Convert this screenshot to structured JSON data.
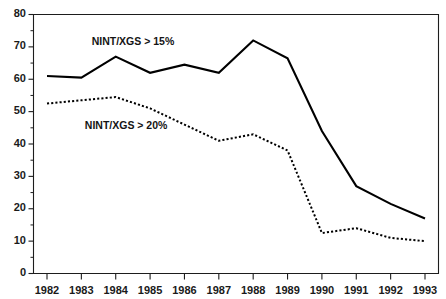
{
  "chart_data": {
    "type": "line",
    "title": "",
    "xlabel": "",
    "ylabel": "",
    "ylim": [
      0,
      80
    ],
    "ytick_labels": [
      "80",
      "70",
      "60",
      "50",
      "40",
      "30",
      "20",
      "10",
      "0"
    ],
    "ytick_values": [
      80,
      70,
      60,
      50,
      40,
      30,
      20,
      10,
      0
    ],
    "grid": false,
    "legend_position": "inline-annotation",
    "categories": [
      "1982",
      "1983",
      "1984",
      "1985",
      "1986",
      "1987",
      "1988",
      "1989",
      "1990",
      "1991",
      "1992",
      "1993"
    ],
    "x": [
      1982,
      1983,
      1984,
      1985,
      1986,
      1987,
      1988,
      1989,
      1990,
      1991,
      1992,
      1993
    ],
    "series": [
      {
        "name": "NINT/XGS > 15%",
        "style": "solid",
        "color": "#000000",
        "values": [
          61,
          60.5,
          67,
          62,
          64.5,
          62,
          72,
          66.5,
          44,
          27,
          21.5,
          17
        ]
      },
      {
        "name": "NINT/XGS > 20%",
        "style": "dotted",
        "color": "#000000",
        "values": [
          52.5,
          53.5,
          54.5,
          51,
          46,
          41,
          43,
          38,
          12.5,
          14,
          11,
          10
        ]
      }
    ],
    "annotations": [
      {
        "text": "NINT/XGS > 15%",
        "x": 1983.3,
        "y": 71.5
      },
      {
        "text": "NINT/XGS > 20%",
        "x": 1983.1,
        "y": 45.5
      }
    ]
  },
  "clipped_header": {
    "text": ""
  }
}
